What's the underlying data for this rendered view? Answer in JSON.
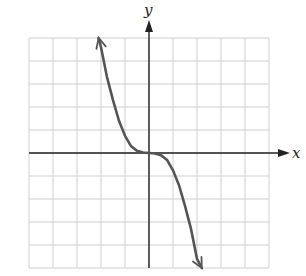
{
  "chart_data": {
    "type": "line",
    "title": "",
    "xlabel": "x",
    "ylabel": "y",
    "xlim": [
      -5,
      5
    ],
    "ylim": [
      -5,
      5
    ],
    "grid": true,
    "tick_labels_shown": false,
    "series": [
      {
        "name": "y = -x^3 (approx)",
        "x": [
          -2.1,
          -2.0,
          -1.75,
          -1.5,
          -1.25,
          -1.0,
          -0.75,
          -0.5,
          -0.25,
          0,
          0.25,
          0.5,
          0.75,
          1.0,
          1.25,
          1.5,
          1.75,
          2.0,
          2.2
        ],
        "y": [
          5.0,
          4.6,
          3.3,
          2.3,
          1.4,
          0.75,
          0.3,
          0.1,
          0.02,
          0,
          -0.02,
          -0.1,
          -0.3,
          -0.75,
          -1.4,
          -2.3,
          -3.3,
          -4.6,
          -5.0
        ],
        "end_arrows": true
      }
    ],
    "colors": {
      "curve": "#555555",
      "axes": "#222222",
      "grid": "#cfcfcf"
    }
  },
  "labels": {
    "x_axis": "x",
    "y_axis": "y"
  }
}
